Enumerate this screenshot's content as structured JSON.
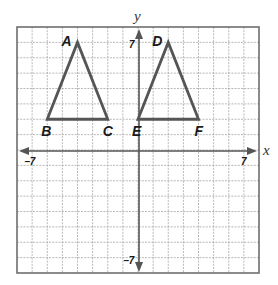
{
  "diagram": {
    "type": "coordinate-plane",
    "x_axis_label": "x",
    "y_axis_label": "y",
    "grid_range": {
      "x": [
        -8,
        8
      ],
      "y": [
        -8,
        8
      ]
    },
    "tick_labels": {
      "x_min": "−7",
      "x_max": "7",
      "y_min": "−7",
      "y_max": "7"
    },
    "colors": {
      "grid": "#9a9a9a",
      "axis": "#555555",
      "shape": "#555555",
      "text": "#1a1a1a"
    },
    "triangles": [
      {
        "name": "ABC",
        "vertices": [
          {
            "label": "A",
            "x": -4,
            "y": 7
          },
          {
            "label": "B",
            "x": -6,
            "y": 2
          },
          {
            "label": "C",
            "x": -2,
            "y": 2
          }
        ]
      },
      {
        "name": "DEF",
        "vertices": [
          {
            "label": "D",
            "x": 2,
            "y": 7
          },
          {
            "label": "E",
            "x": 0,
            "y": 2
          },
          {
            "label": "F",
            "x": 4,
            "y": 2
          }
        ]
      }
    ]
  }
}
